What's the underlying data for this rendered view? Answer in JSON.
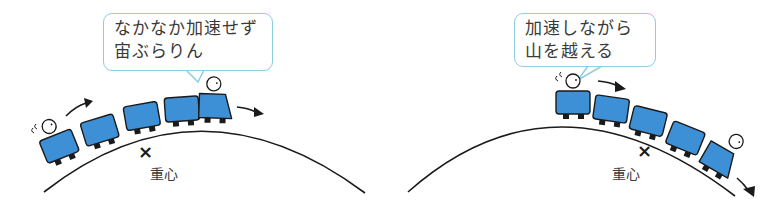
{
  "colors": {
    "car_fill": "#3d8fd6",
    "outline": "#1a1a1a",
    "bubble_border": "#8fcde3",
    "text": "#3a3a3a",
    "background": "#ffffff"
  },
  "panels": [
    {
      "id": "slow-train",
      "bubble": {
        "lines": [
          "なかなか加速せず",
          "宙ぶらりん"
        ]
      },
      "center_of_gravity_marker": "×",
      "center_of_gravity_label": "重心",
      "cars": 5,
      "riders": [
        "rear-car",
        "front-car"
      ],
      "motion_arrows": 2
    },
    {
      "id": "fast-train",
      "bubble": {
        "lines": [
          "加速しながら",
          "山を越える"
        ]
      },
      "center_of_gravity_marker": "×",
      "center_of_gravity_label": "重心",
      "cars": 5,
      "riders": [
        "rear-car",
        "front-car"
      ],
      "motion_arrows": 2
    }
  ]
}
